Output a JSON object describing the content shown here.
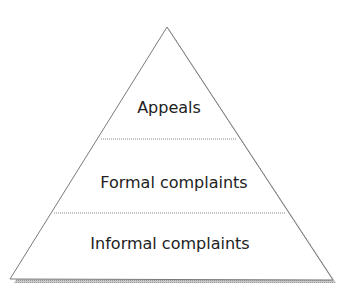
{
  "diagram": {
    "type": "pyramid",
    "levels": [
      {
        "label": "Appeals",
        "position": "top"
      },
      {
        "label": "Formal complaints",
        "position": "middle"
      },
      {
        "label": "Informal complaints",
        "position": "bottom"
      }
    ],
    "colors": {
      "fill": "#ffffff",
      "outline": "#7a7a7a",
      "shadow": "#b5b5b5",
      "text": "#222222"
    }
  }
}
